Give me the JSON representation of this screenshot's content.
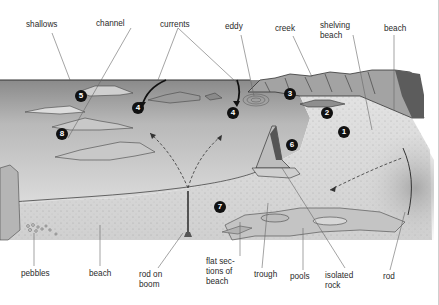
{
  "diagram": {
    "type": "illustrated coastal fishing diagram",
    "colors": {
      "sea_top": "#8d8d8d",
      "sea_bottom": "#d6d6d6",
      "beach": "#e6e6e6",
      "sand_dark": "#bdbdbd",
      "rock": "#9a9a9a",
      "cliff": "#6e6e6e",
      "marker": "#111111",
      "leader_line": "#555555"
    },
    "labels": {
      "top": [
        {
          "id": "shallows",
          "text": "shallows",
          "x": 26,
          "y": 20
        },
        {
          "id": "channel",
          "text": "channel",
          "x": 96,
          "y": 19
        },
        {
          "id": "currents",
          "text": "currents",
          "x": 160,
          "y": 20
        },
        {
          "id": "eddy",
          "text": "eddy",
          "x": 225,
          "y": 22
        },
        {
          "id": "creek",
          "text": "creek",
          "x": 275,
          "y": 24
        },
        {
          "id": "shelving-beach",
          "text": "shelving\nbeach",
          "x": 320,
          "y": 21
        },
        {
          "id": "beach-top",
          "text": "beach",
          "x": 384,
          "y": 24
        }
      ],
      "bottom": [
        {
          "id": "pebbles",
          "text": "pebbles",
          "x": 21,
          "y": 269
        },
        {
          "id": "beach-bottom",
          "text": "beach",
          "x": 89,
          "y": 269
        },
        {
          "id": "rod-on-boom",
          "text": "rod on\nboom",
          "x": 139,
          "y": 270
        },
        {
          "id": "flat-sections-of-beach",
          "text": "flat sec-\ntions of\nbeach",
          "x": 206,
          "y": 257
        },
        {
          "id": "trough",
          "text": "trough",
          "x": 254,
          "y": 270
        },
        {
          "id": "pools",
          "text": "pools",
          "x": 290,
          "y": 272
        },
        {
          "id": "isolated-rock",
          "text": "isolated\nrock",
          "x": 325,
          "y": 271
        },
        {
          "id": "rod",
          "text": "rod",
          "x": 383,
          "y": 272
        }
      ]
    },
    "markers": [
      {
        "number": "1",
        "x": 344,
        "y": 132
      },
      {
        "number": "2",
        "x": 327,
        "y": 113
      },
      {
        "number": "3",
        "x": 290,
        "y": 94
      },
      {
        "number": "4",
        "x": 138,
        "y": 108
      },
      {
        "number": "4",
        "x": 233,
        "y": 113
      },
      {
        "number": "5",
        "x": 81,
        "y": 96
      },
      {
        "number": "6",
        "x": 292,
        "y": 145
      },
      {
        "number": "7",
        "x": 220,
        "y": 207
      },
      {
        "number": "8",
        "x": 62,
        "y": 134
      }
    ]
  }
}
